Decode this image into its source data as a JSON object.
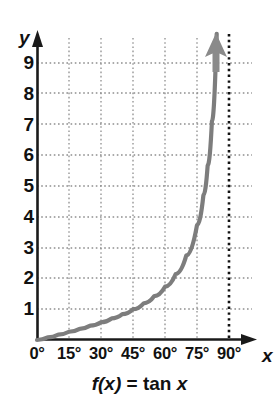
{
  "caption": {
    "fx": "f(x)",
    "equals": "=",
    "fn": "tan",
    "var": "x",
    "full": "f(x) = tan x"
  },
  "axes": {
    "y_name": "y",
    "x_name": "x"
  },
  "colors": {
    "curve": "#7d7d7d",
    "axis": "#1a1a1a",
    "grid": "#8e8e8e",
    "asymptote": "#111111",
    "background": "#ffffff"
  },
  "chart_data": {
    "type": "line",
    "xlabel": "x",
    "ylabel": "y",
    "xlim": [
      0,
      90
    ],
    "ylim": [
      0,
      9.6
    ],
    "grid": true,
    "legend": null,
    "x_tick_labels": [
      "0°",
      "15°",
      "30°",
      "45°",
      "60°",
      "75°",
      "90°"
    ],
    "x_ticks": [
      0,
      15,
      30,
      45,
      60,
      75,
      90
    ],
    "y_tick_labels": [
      "1",
      "2",
      "3",
      "4",
      "5",
      "6",
      "7",
      "8",
      "9"
    ],
    "y_ticks": [
      1,
      2,
      3,
      4,
      5,
      6,
      7,
      8,
      9
    ],
    "annotations": [
      {
        "name": "vertical-asymptote",
        "at_x": 90,
        "style": "dotted",
        "label": ""
      },
      {
        "name": "curve-arrowhead",
        "at_x": 86.5,
        "direction": "up"
      }
    ],
    "series": [
      {
        "name": "tan x",
        "x": [
          0,
          5,
          10,
          15,
          20,
          25,
          30,
          35,
          40,
          45,
          50,
          55,
          60,
          65,
          70,
          75,
          78,
          80,
          82,
          84,
          85,
          86,
          86.5
        ],
        "values": [
          0,
          0.087,
          0.176,
          0.268,
          0.364,
          0.466,
          0.577,
          0.7,
          0.839,
          1.0,
          1.192,
          1.428,
          1.732,
          2.145,
          2.747,
          3.732,
          4.705,
          5.671,
          7.115,
          9.514,
          11.43,
          14.3,
          16.35
        ]
      }
    ]
  }
}
